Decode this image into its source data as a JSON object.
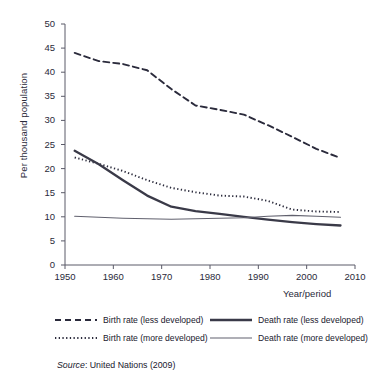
{
  "chart_data": {
    "type": "line",
    "title": "",
    "xlabel": "Year/period",
    "ylabel": "Per thousand population",
    "xlim": [
      1950,
      2010
    ],
    "ylim": [
      0,
      50
    ],
    "xticks": [
      1950,
      1960,
      1970,
      1980,
      1990,
      2000,
      2010
    ],
    "yticks": [
      0,
      5,
      10,
      15,
      20,
      25,
      30,
      35,
      40,
      45,
      50
    ],
    "grid": false,
    "legend_position": "below-plot-two-columns",
    "x": [
      1952,
      1957,
      1962,
      1967,
      1972,
      1977,
      1982,
      1987,
      1992,
      1997,
      2002,
      2007
    ],
    "series": [
      {
        "name": "Birth rate (less developed)",
        "style": "dashed",
        "color": "#2b2b3c",
        "width": 1.9,
        "values": [
          44.0,
          42.3,
          41.7,
          40.4,
          36.5,
          33.1,
          32.2,
          31.2,
          29.0,
          26.6,
          24.1,
          22.2
        ]
      },
      {
        "name": "Birth rate (more developed)",
        "style": "dotted",
        "color": "#2b2b3c",
        "width": 1.9,
        "values": [
          22.3,
          21.0,
          19.5,
          17.6,
          16.0,
          15.1,
          14.4,
          14.2,
          13.3,
          11.5,
          11.1,
          11.0
        ]
      },
      {
        "name": "Death rate (less developed)",
        "style": "solid-thick",
        "color": "#3a3a48",
        "width": 2.3,
        "values": [
          23.7,
          20.9,
          17.6,
          14.4,
          12.1,
          11.2,
          10.6,
          10.0,
          9.4,
          8.9,
          8.5,
          8.2
        ]
      },
      {
        "name": "Death rate (more developed)",
        "style": "solid-thin",
        "color": "#61616e",
        "width": 1.1,
        "values": [
          10.1,
          9.9,
          9.7,
          9.6,
          9.5,
          9.6,
          9.7,
          9.8,
          10.1,
          10.3,
          10.1,
          9.9
        ]
      }
    ],
    "legend": [
      {
        "label": "Birth rate (less developed)",
        "style": "dashed",
        "column": "left"
      },
      {
        "label": "Birth rate (more developed)",
        "style": "dotted",
        "column": "left"
      },
      {
        "label": "Death rate (less developed)",
        "style": "solid-thick",
        "column": "right"
      },
      {
        "label": "Death rate (more developed)",
        "style": "solid-thin",
        "column": "right"
      }
    ],
    "source_prefix": "Source",
    "source_text": ": United Nations (2009)"
  }
}
